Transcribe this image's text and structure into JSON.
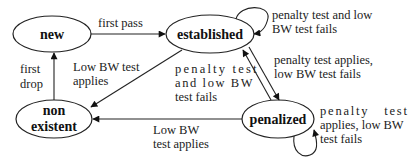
{
  "diagram": {
    "type": "state-machine",
    "nodes": {
      "new": {
        "label": "new"
      },
      "established": {
        "label": "established"
      },
      "non_existent": {
        "line1": "non",
        "line2": "existent"
      },
      "penalized": {
        "label": "penalized"
      }
    },
    "edges": {
      "new_to_established": {
        "from": "new",
        "to": "established",
        "label": "first pass"
      },
      "nonexistent_to_new": {
        "from": "non existent",
        "to": "new",
        "line1": "first",
        "line2": "drop"
      },
      "established_to_nonexistent": {
        "from": "established",
        "to": "non existent",
        "line1": "Low BW test",
        "line2": "applies"
      },
      "established_self": {
        "from": "established",
        "to": "established",
        "line1": "penalty test and low",
        "line2": "BW test fails"
      },
      "penalized_to_established": {
        "from": "penalized",
        "to": "established",
        "line1": "penalty test",
        "line2": "and low BW",
        "line3": "test fails"
      },
      "established_to_penalized": {
        "from": "established",
        "to": "penalized",
        "line1": "penalty test applies,",
        "line2": "low BW test fails"
      },
      "penalized_to_nonexistent": {
        "from": "penalized",
        "to": "non existent",
        "line1": "Low BW",
        "line2": "test applies"
      },
      "penalized_self": {
        "from": "penalized",
        "to": "penalized",
        "line1": "penalty   test",
        "line2": "applies, low BW",
        "line3": "test fails"
      }
    }
  }
}
